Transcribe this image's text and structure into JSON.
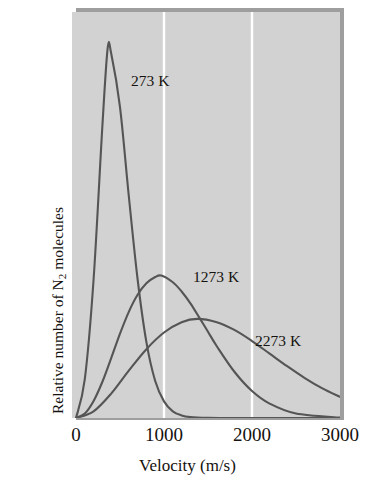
{
  "figure": {
    "background_color": "#ffffff",
    "panel_color": "#d2d2d2",
    "panel_shadow_color": "#9e9e9e",
    "gridline_color": "#ffffff",
    "curve_color": "#555555",
    "text_color": "#15120f"
  },
  "axis": {
    "y_label_line1": "Relative number of N",
    "y_label_sub": "2",
    "y_label_line1_rest": " molecules",
    "y_label_line2": "with given velocity",
    "x_label": "Velocity (m/s)",
    "x_ticks": [
      "0",
      "1000",
      "2000",
      "3000"
    ]
  },
  "curve_labels": [
    {
      "text": "273 K",
      "left": 131,
      "top": 72
    },
    {
      "text": "1273 K",
      "left": 193,
      "top": 268
    },
    {
      "text": "2273 K",
      "left": 255,
      "top": 332
    }
  ],
  "chart_data": {
    "type": "line",
    "title": "",
    "xlabel": "Velocity (m/s)",
    "ylabel": "Relative number of N2 molecules with given velocity",
    "xlim": [
      0,
      3000
    ],
    "ylim": [
      0,
      1.0
    ],
    "xticks": [
      0,
      1000,
      2000,
      3000
    ],
    "yticks": [],
    "grid": "vertical gridlines at 1000 and 2000, white",
    "legend": "inline curve annotations",
    "distribution": "Maxwell-Boltzmann speed distribution for N2",
    "series": [
      {
        "name": "273 K",
        "temperature_K": 273,
        "color": "#555555",
        "peak_velocity": 360,
        "peak_relative_height": 1.0,
        "x": [
          0,
          100,
          200,
          300,
          360,
          400,
          500,
          600,
          700,
          800,
          900,
          1000,
          1100,
          1200,
          1300,
          1500,
          1700,
          2000,
          2500,
          3000
        ],
        "y": [
          0.0,
          0.105,
          0.375,
          0.79,
          1.0,
          0.985,
          0.84,
          0.6,
          0.375,
          0.205,
          0.1,
          0.045,
          0.018,
          0.007,
          0.0025,
          0.0003,
          0.0,
          0.0,
          0.0,
          0.0
        ]
      },
      {
        "name": "1273 K",
        "temperature_K": 1273,
        "color": "#555555",
        "peak_velocity": 970,
        "peak_relative_height": 0.385,
        "x": [
          0,
          100,
          200,
          300,
          400,
          500,
          600,
          700,
          800,
          900,
          970,
          1100,
          1200,
          1300,
          1400,
          1500,
          1600,
          1800,
          2000,
          2200,
          2500,
          3000
        ],
        "y": [
          0.0,
          0.012,
          0.046,
          0.098,
          0.162,
          0.228,
          0.287,
          0.333,
          0.364,
          0.381,
          0.385,
          0.367,
          0.342,
          0.31,
          0.272,
          0.233,
          0.194,
          0.125,
          0.073,
          0.039,
          0.012,
          0.001
        ]
      },
      {
        "name": "2273 K",
        "temperature_K": 2273,
        "color": "#555555",
        "peak_velocity": 1380,
        "peak_relative_height": 0.268,
        "x": [
          0,
          200,
          400,
          600,
          800,
          1000,
          1200,
          1380,
          1600,
          1800,
          2000,
          2200,
          2400,
          2600,
          2800,
          3000
        ],
        "y": [
          0.0,
          0.018,
          0.066,
          0.128,
          0.186,
          0.231,
          0.259,
          0.268,
          0.259,
          0.238,
          0.208,
          0.174,
          0.14,
          0.108,
          0.08,
          0.057
        ]
      }
    ]
  }
}
